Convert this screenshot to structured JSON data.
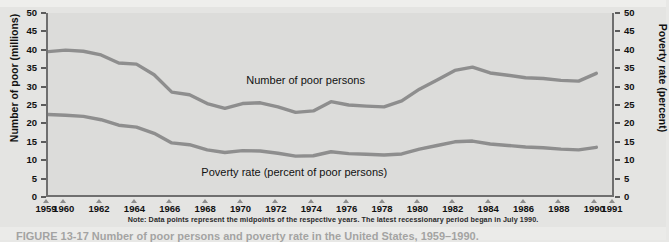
{
  "figure": {
    "note": "Note: Data points represent the midpoints of the respective years. The latest recessionary period began in July 1990.",
    "caption": "FIGURE 13-17  Number of poor persons and poverty rate in the United States, 1959–1990.",
    "line_color": "#8e8e8e",
    "axis_color": "#6f6f6f",
    "plot_bg": "#dcdcda",
    "page_bg": "#e4e4e2"
  },
  "chart_data": {
    "type": "line",
    "title": "",
    "xlabel": "",
    "ylabel": "Number of poor (millions)",
    "y2label": "Poverty rate (percent)",
    "xlim": [
      1959,
      1991
    ],
    "ylim": [
      0,
      50
    ],
    "y2lim": [
      0,
      50
    ],
    "grid": false,
    "legend_position": "inline-annotations",
    "yticks": [
      0,
      5,
      10,
      15,
      20,
      25,
      30,
      35,
      40,
      45,
      50
    ],
    "y2ticks": [
      0,
      5,
      10,
      15,
      20,
      25,
      30,
      35,
      40,
      45,
      50
    ],
    "xticks": [
      1959,
      1960,
      1962,
      1964,
      1966,
      1968,
      1970,
      1972,
      1974,
      1976,
      1978,
      1980,
      1982,
      1984,
      1986,
      1988,
      1990,
      1991
    ],
    "xticklabels": [
      "1959",
      "1960",
      "1962",
      "1964",
      "1966",
      "1968",
      "1970",
      "1972",
      "1974",
      "1976",
      "1978",
      "1980",
      "1982",
      "1984",
      "1986",
      "1988",
      "1990",
      "1991"
    ],
    "annotations": [
      {
        "text": "Number of poor persons",
        "x": 1974,
        "y": 31.5
      },
      {
        "text": "Poverty rate (percent of poor persons)",
        "x": 1974,
        "y": 6.5
      }
    ],
    "x": [
      1959,
      1960,
      1961,
      1962,
      1963,
      1964,
      1965,
      1966,
      1967,
      1968,
      1969,
      1970,
      1971,
      1972,
      1973,
      1974,
      1975,
      1976,
      1977,
      1978,
      1979,
      1980,
      1981,
      1982,
      1983,
      1984,
      1985,
      1986,
      1987,
      1988,
      1989,
      1990
    ],
    "series": [
      {
        "name": "Number of poor persons",
        "unit": "millions",
        "axis": "left",
        "values": [
          39.5,
          39.9,
          39.6,
          38.6,
          36.4,
          36.1,
          33.2,
          28.5,
          27.8,
          25.4,
          24.1,
          25.4,
          25.6,
          24.5,
          23.0,
          23.4,
          25.9,
          25.0,
          24.7,
          24.5,
          26.1,
          29.3,
          31.8,
          34.4,
          35.3,
          33.7,
          33.1,
          32.4,
          32.2,
          31.7,
          31.5,
          33.6
        ]
      },
      {
        "name": "Poverty rate (percent of poor persons)",
        "unit": "percent",
        "axis": "right",
        "values": [
          22.4,
          22.2,
          21.9,
          21.0,
          19.5,
          19.0,
          17.3,
          14.7,
          14.2,
          12.8,
          12.1,
          12.6,
          12.5,
          11.9,
          11.1,
          11.2,
          12.3,
          11.8,
          11.6,
          11.4,
          11.7,
          13.0,
          14.0,
          15.0,
          15.2,
          14.4,
          14.0,
          13.6,
          13.4,
          13.0,
          12.8,
          13.5
        ]
      }
    ]
  }
}
